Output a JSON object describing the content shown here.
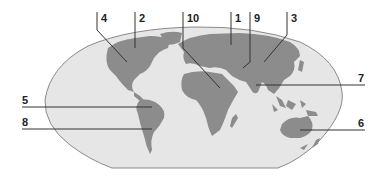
{
  "diagram": {
    "type": "world-map-labeling",
    "colors": {
      "ocean": "#e6e6e6",
      "ocean_border": "#8a8a8a",
      "land": "#8c8c8c",
      "leader_line": "#333333",
      "label_text": "#222222"
    },
    "labels": [
      {
        "id": "4",
        "text": "4",
        "target": "North America (west)"
      },
      {
        "id": "2",
        "text": "2",
        "target": "North America (north)"
      },
      {
        "id": "10",
        "text": "10",
        "target": "Africa"
      },
      {
        "id": "1",
        "text": "1",
        "target": "Europe"
      },
      {
        "id": "9",
        "text": "9",
        "target": "Central Asia"
      },
      {
        "id": "3",
        "text": "3",
        "target": "East Asia"
      },
      {
        "id": "7",
        "text": "7",
        "target": "South Asia"
      },
      {
        "id": "5",
        "text": "5",
        "target": "South America (north)"
      },
      {
        "id": "8",
        "text": "8",
        "target": "South America (south)"
      },
      {
        "id": "6",
        "text": "6",
        "target": "Australia"
      }
    ]
  }
}
